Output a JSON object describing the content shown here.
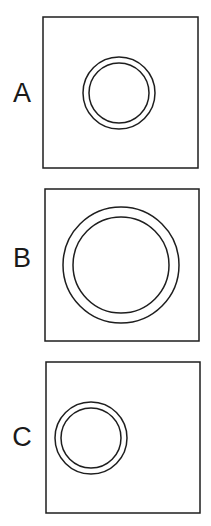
{
  "figure": {
    "stroke_color": "#1e1e1e",
    "panels": [
      {
        "label": "A",
        "box": {
          "x": 43,
          "y": 17,
          "w": 155,
          "h": 151
        },
        "circle": {
          "cx": 119,
          "cy": 93,
          "r_outer": 36,
          "r_inner": 30
        }
      },
      {
        "label": "B",
        "box": {
          "x": 45,
          "y": 189,
          "w": 154,
          "h": 152
        },
        "circle": {
          "cx": 121,
          "cy": 265,
          "r_outer": 58,
          "r_inner": 48
        }
      },
      {
        "label": "C",
        "box": {
          "x": 46,
          "y": 362,
          "w": 154,
          "h": 151
        },
        "circle": {
          "cx": 91,
          "cy": 438,
          "r_outer": 36,
          "r_inner": 30
        }
      }
    ]
  }
}
